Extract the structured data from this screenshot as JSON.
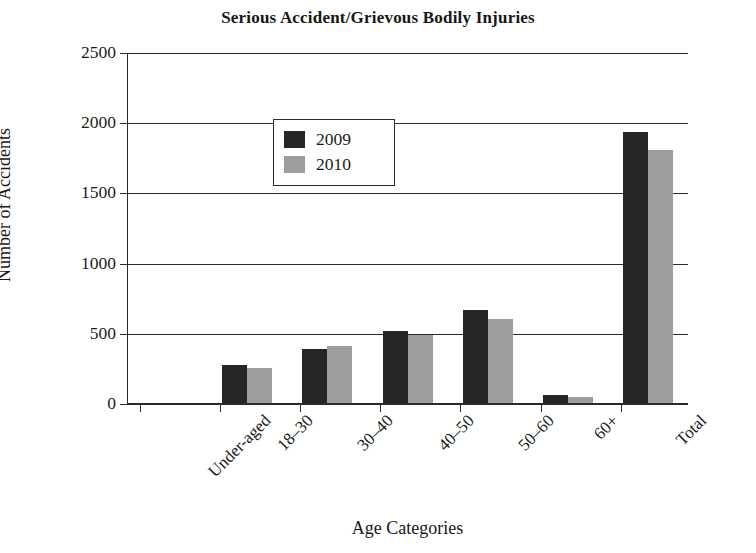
{
  "chart_data": {
    "type": "bar",
    "title": "Serious Accident/Grievous Bodily Injuries",
    "xlabel": "Age Categories",
    "ylabel": "Number of Accidents",
    "categories": [
      "Under-aged",
      "18–30",
      "30–40",
      "40–50",
      "50–60",
      "60+",
      "Total"
    ],
    "series": [
      {
        "name": "2009",
        "color": "#262626",
        "values": [
          10,
          280,
          390,
          520,
          670,
          65,
          1940
        ]
      },
      {
        "name": "2010",
        "color": "#9d9d9d",
        "values": [
          8,
          255,
          415,
          495,
          605,
          48,
          1810
        ]
      }
    ],
    "ylim": [
      0,
      2500
    ],
    "yticks": [
      0,
      500,
      1000,
      1500,
      2000,
      2500
    ],
    "ytick_labels": [
      "0",
      "500",
      "1000",
      "1500",
      "2000",
      "2500"
    ],
    "grid": true,
    "grid_axis": "y",
    "legend_position": "upper-left",
    "bar_orientation": "vertical",
    "xtick_label_rotation": -45
  },
  "figure": {
    "background_color": "#ffffff",
    "axis_color": "#2b2b2b",
    "text_color": "#1a1a1a"
  }
}
